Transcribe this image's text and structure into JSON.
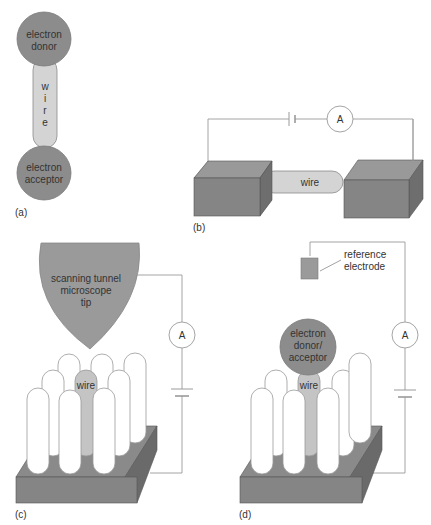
{
  "panels": {
    "a": {
      "label": "(a)",
      "donor_line1": "electron",
      "donor_line2": "donor",
      "wire_letters": [
        "w",
        "i",
        "r",
        "e"
      ],
      "acceptor_line1": "electron",
      "acceptor_line2": "acceptor"
    },
    "b": {
      "label": "(b)",
      "wire": "wire",
      "ammeter": "A"
    },
    "c": {
      "label": "(c)",
      "tip_line1": "scanning tunnel",
      "tip_line2": "microscope",
      "tip_line3": "tip",
      "wire": "wire",
      "ammeter": "A"
    },
    "d": {
      "label": "(d)",
      "ref_line1": "reference",
      "ref_line2": "electrode",
      "molecule_line1": "electron",
      "molecule_line2": "donor/",
      "molecule_line3": "acceptor",
      "wire": "wire",
      "ammeter": "A"
    }
  },
  "colors": {
    "dark_gray": "#7a7a7a",
    "mid_gray": "#9a9a9a",
    "light_gray": "#d4d4d4",
    "line": "#9a9a9a",
    "white": "#ffffff"
  }
}
